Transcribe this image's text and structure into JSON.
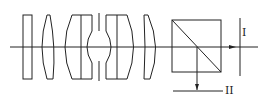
{
  "diagram": {
    "type": "optical-system-schematic",
    "stroke_color": "#222222",
    "background": "#ffffff",
    "optical_axis": {
      "label": ""
    },
    "components": [
      {
        "id": "lens-1",
        "kind": "plano-parallel element"
      },
      {
        "id": "lens-2",
        "kind": "convex meniscus element"
      },
      {
        "id": "lens-group-3",
        "kind": "cemented doublet (front)"
      },
      {
        "id": "aperture-stop",
        "kind": "stop"
      },
      {
        "id": "lens-group-4",
        "kind": "cemented doublet (rear)"
      },
      {
        "id": "lens-5",
        "kind": "convex element"
      },
      {
        "id": "beam-splitter-cube",
        "kind": "beam splitter prism"
      },
      {
        "id": "image-plane-1",
        "kind": "image plane"
      },
      {
        "id": "image-plane-2",
        "kind": "image plane"
      }
    ],
    "labels": {
      "image_plane_1": "I",
      "image_plane_2": "II"
    }
  }
}
